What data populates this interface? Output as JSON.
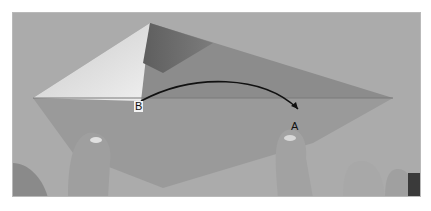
{
  "image": {
    "description": "Grayscale photo of hands folding origami paper; point B is folded over to point A",
    "labels": [
      {
        "id": "B",
        "text": "B"
      },
      {
        "id": "A",
        "text": "A"
      }
    ],
    "arrow": {
      "from": "B",
      "to": "A",
      "color": "#111111"
    },
    "colors": {
      "background": "#a9a9a9",
      "paper_light": "#d9d9d9",
      "paper_mid": "#8e8e8e",
      "paper_dark": "#6e6e6e",
      "skin": "#9a9a9a",
      "frame_border": "#b9b9b9"
    }
  }
}
